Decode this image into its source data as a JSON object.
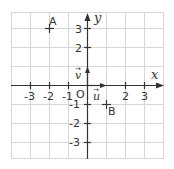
{
  "diagram": {
    "type": "cartesian-grid",
    "axes": {
      "x_label": "x",
      "y_label": "y",
      "origin_label": "O",
      "x_ticks": [
        "-3",
        "-2",
        "-1",
        "2",
        "3"
      ],
      "y_ticks": [
        "3",
        "2",
        "-1",
        "-2",
        "-3"
      ]
    },
    "vectors": [
      {
        "name": "u",
        "label": "u",
        "arrow": "→",
        "from": [
          0,
          0
        ],
        "to": [
          1,
          0
        ]
      },
      {
        "name": "v",
        "label": "v",
        "arrow": "→",
        "from": [
          0,
          0
        ],
        "to": [
          0,
          1
        ]
      }
    ],
    "points": [
      {
        "name": "A",
        "label": "A",
        "x": -2,
        "y": 3
      },
      {
        "name": "B",
        "label": "B",
        "x": 1,
        "y": -1
      }
    ],
    "colors": {
      "grid": "#d6d6d6",
      "axis": "#333333",
      "text": "#333333"
    }
  }
}
